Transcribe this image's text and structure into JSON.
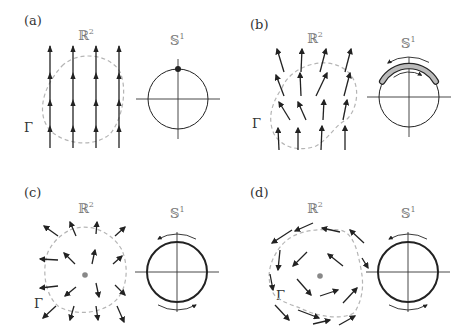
{
  "figure": {
    "panels": [
      {
        "id": "a",
        "label": "(a)",
        "label_pos": [
          24,
          25
        ],
        "plane_label": "ℝ",
        "plane_sup": "2",
        "plane_label_pos": [
          78,
          40
        ],
        "circle_label": "𝕊",
        "circle_sup": "1",
        "circle_label_pos": [
          170,
          45
        ],
        "gamma_label": "Γ",
        "gamma_pos": [
          24,
          132
        ],
        "curve_path": "M 62 66 C 78 50, 110 54, 120 72 C 128 90, 122 120, 110 134 C 94 148, 66 144, 52 132 C 38 120, 38 92, 62 66 Z",
        "arrows": [
          [
            50,
            150,
            50,
            45
          ],
          [
            73,
            150,
            73,
            45
          ],
          [
            96,
            150,
            96,
            45
          ],
          [
            119,
            150,
            119,
            45
          ],
          [
            50,
            100,
            50,
            73
          ],
          [
            73,
            100,
            73,
            73
          ],
          [
            96,
            100,
            96,
            73
          ],
          [
            119,
            100,
            119,
            73
          ],
          [
            50,
            126,
            50,
            100
          ],
          [
            73,
            126,
            73,
            100
          ],
          [
            96,
            126,
            96,
            100
          ],
          [
            119,
            126,
            119,
            100
          ]
        ],
        "arrow_heads": [
          [
            50,
            48
          ],
          [
            73,
            48
          ],
          [
            96,
            48
          ],
          [
            119,
            48
          ],
          [
            50,
            75
          ],
          [
            73,
            75
          ],
          [
            96,
            75
          ],
          [
            119,
            75
          ],
          [
            50,
            102
          ],
          [
            73,
            102
          ],
          [
            96,
            102
          ],
          [
            119,
            102
          ],
          [
            50,
            128
          ],
          [
            73,
            128
          ],
          [
            96,
            128
          ],
          [
            119,
            128
          ]
        ],
        "circle": {
          "cx": 178,
          "cy": 99,
          "r": 30,
          "stroke_width": 1.0,
          "axis_extent": 42
        },
        "point_on_circle": {
          "cx": 178,
          "cy": 69,
          "r": 3
        },
        "rotation_arrows": "none",
        "center_dot": false
      },
      {
        "id": "b",
        "label": "(b)",
        "label_pos": [
          250,
          29
        ],
        "plane_label": "ℝ",
        "plane_sup": "2",
        "plane_label_pos": [
          307,
          43
        ],
        "circle_label": "𝕊",
        "circle_sup": "1",
        "circle_label_pos": [
          401,
          48
        ],
        "gamma_label": "Γ",
        "gamma_pos": [
          252,
          128
        ],
        "curve_path": "M 282 88 C 290 66, 330 52, 350 74 C 362 88, 356 112, 346 120 C 334 126, 330 138, 316 146 C 300 152, 282 148, 274 134 C 266 116, 274 100, 282 88 Z",
        "arrows_b": [
          [
            284,
            72,
            277,
            49
          ],
          [
            301,
            72,
            302,
            49
          ],
          [
            320,
            72,
            326,
            49
          ],
          [
            345,
            72,
            351,
            49
          ],
          [
            284,
            96,
            276,
            75
          ],
          [
            301,
            96,
            300,
            73
          ],
          [
            316,
            96,
            327,
            73
          ],
          [
            344,
            96,
            350,
            73
          ],
          [
            290,
            120,
            279,
            102
          ],
          [
            306,
            120,
            298,
            102
          ],
          [
            323,
            120,
            324,
            100
          ],
          [
            343,
            120,
            347,
            100
          ],
          [
            279,
            150,
            278,
            128
          ],
          [
            298,
            150,
            298,
            128
          ],
          [
            321,
            150,
            322,
            126
          ],
          [
            345,
            150,
            345,
            126
          ]
        ],
        "circle": {
          "cx": 409,
          "cy": 97,
          "r": 30,
          "stroke_width": 1.0,
          "axis_extent": 42
        },
        "band": {
          "start_deg": 200,
          "end_deg": 340,
          "r": 33
        },
        "rotation_arrows": "oscillating",
        "center_dot": false
      },
      {
        "id": "c",
        "label": "(c)",
        "label_pos": [
          24,
          197
        ],
        "plane_label": "ℝ",
        "plane_sup": "2",
        "plane_label_pos": [
          78,
          213
        ],
        "circle_label": "𝕊",
        "circle_sup": "1",
        "circle_label_pos": [
          170,
          218
        ],
        "gamma_label": "Γ",
        "gamma_pos": [
          34,
          308
        ],
        "curve_path": "M 70 230 C 90 222, 112 232, 122 250 C 130 270, 126 292, 114 302 C 100 314, 74 316, 58 306 C 44 294, 42 268, 48 252 C 54 240, 62 234, 70 230 Z",
        "center_point": [
          85,
          275
        ],
        "arrows_c": [
          [
            58,
            236,
            44,
            226
          ],
          [
            76,
            236,
            70,
            222
          ],
          [
            96,
            234,
            97,
            222
          ],
          [
            115,
            236,
            125,
            227
          ],
          [
            75,
            264,
            64,
            253
          ],
          [
            92,
            264,
            95,
            250
          ],
          [
            113,
            264,
            122,
            256
          ],
          [
            58,
            260,
            40,
            259
          ],
          [
            58,
            286,
            40,
            288
          ],
          [
            76,
            287,
            65,
            296
          ],
          [
            96,
            283,
            99,
            297
          ],
          [
            115,
            285,
            125,
            295
          ],
          [
            56,
            306,
            43,
            318
          ],
          [
            74,
            306,
            70,
            320
          ],
          [
            96,
            306,
            98,
            320
          ],
          [
            117,
            306,
            124,
            322
          ]
        ],
        "circle": {
          "cx": 177,
          "cy": 272,
          "r": 30,
          "stroke_width": 2.0,
          "axis_extent": 42
        },
        "rotation_arrows": "full",
        "center_dot": true
      },
      {
        "id": "d",
        "label": "(d)",
        "label_pos": [
          250,
          197
        ],
        "plane_label": "ℝ",
        "plane_sup": "2",
        "plane_label_pos": [
          307,
          213
        ],
        "circle_label": "𝕊",
        "circle_sup": "1",
        "circle_label_pos": [
          401,
          218
        ],
        "gamma_label": "Γ",
        "gamma_pos": [
          276,
          300
        ],
        "curve_path": "M 278 250 C 290 232, 310 228, 340 230 C 352 232, 357 248, 360 264 C 364 282, 364 296, 355 312 C 345 320, 320 318, 300 308 C 290 304, 274 300, 272 290 C 266 276, 270 262, 278 250 Z",
        "center_point": [
          320,
          276
        ],
        "arrows_d": [
          [
            313,
            223,
            295,
            231
          ],
          [
            292,
            230,
            272,
            243
          ],
          [
            340,
            232,
            322,
            228
          ],
          [
            364,
            243,
            350,
            230
          ],
          [
            280,
            250,
            278,
            270
          ],
          [
            270,
            274,
            273,
            290
          ],
          [
            307,
            252,
            293,
            266
          ],
          [
            343,
            266,
            328,
            254
          ],
          [
            362,
            258,
            368,
            268
          ],
          [
            297,
            279,
            311,
            295
          ],
          [
            320,
            296,
            338,
            290
          ],
          [
            343,
            303,
            357,
            288
          ],
          [
            275,
            305,
            289,
            320
          ],
          [
            298,
            310,
            319,
            318
          ],
          [
            313,
            324,
            330,
            320
          ],
          [
            339,
            325,
            355,
            316
          ]
        ],
        "circle": {
          "cx": 408,
          "cy": 272,
          "r": 30,
          "stroke_width": 2.0,
          "axis_extent": 42
        },
        "rotation_arrows": "full",
        "center_dot": true
      }
    ],
    "colors": {
      "ink": "#222222",
      "label": "#333333",
      "space_label": "#777777",
      "dashed_curve": "#b5b5b5",
      "band_fill": "#bbbbbb",
      "center_dot": "#888888",
      "background": "#ffffff"
    }
  }
}
